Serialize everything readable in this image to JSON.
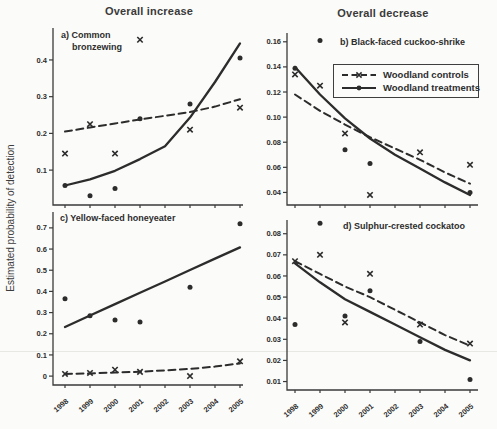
{
  "figure": {
    "column_titles": [
      "Overall increase",
      "Overall decrease"
    ],
    "y_axis_label": "Estimated probability of detection",
    "legend": {
      "position": "top-right panel b",
      "items": [
        {
          "label": "Woodland controls",
          "line": "dashed",
          "marker": "x"
        },
        {
          "label": "Woodland treatments",
          "line": "solid",
          "marker": "dot"
        }
      ]
    },
    "colors": {
      "ink": "#2c2c2c",
      "axis": "#3a3a3a",
      "paper": "#fbfbf9"
    }
  },
  "chart_data": [
    {
      "type": "line",
      "panel": "a",
      "label_lines": [
        "a) Common",
        "bronzewing"
      ],
      "column": "Overall increase",
      "x_categories": [
        "1998",
        "1999",
        "2000",
        "2001",
        "2002",
        "2003",
        "2004",
        "2005"
      ],
      "show_x_labels": false,
      "ylim": [
        0.005,
        0.487
      ],
      "yticks": [
        0.1,
        0.2,
        0.3,
        0.4
      ],
      "ytick_labels": [
        "0.1",
        "0.2",
        "0.3",
        "0.4"
      ],
      "series": [
        {
          "name": "Woodland controls",
          "line": "dashed",
          "marker": "x",
          "point_years": [
            1998,
            1999,
            2000,
            2001,
            2003,
            2005
          ],
          "point_values": [
            0.145,
            0.225,
            0.145,
            0.455,
            0.21,
            0.27
          ],
          "fit_values": [
            0.205,
            0.216,
            0.227,
            0.238,
            0.248,
            0.258,
            0.273,
            0.293
          ]
        },
        {
          "name": "Woodland treatments",
          "line": "solid",
          "marker": "dot",
          "point_years": [
            1998,
            1999,
            2000,
            2001,
            2003,
            2005
          ],
          "point_values": [
            0.058,
            0.03,
            0.05,
            0.24,
            0.28,
            0.405
          ],
          "fit_values": [
            0.058,
            0.075,
            0.098,
            0.13,
            0.165,
            0.243,
            0.34,
            0.445
          ]
        }
      ]
    },
    {
      "type": "line",
      "panel": "b",
      "label_lines": [
        "b) Black-faced cuckoo-shrike"
      ],
      "column": "Overall decrease",
      "x_categories": [
        "1998",
        "1999",
        "2000",
        "2001",
        "2002",
        "2003",
        "2004",
        "2005"
      ],
      "show_x_labels": false,
      "ylim": [
        0.03,
        0.167
      ],
      "yticks": [
        0.04,
        0.06,
        0.08,
        0.1,
        0.12,
        0.14,
        0.16
      ],
      "ytick_labels": [
        "0.04",
        "0.06",
        "0.08",
        "0.10",
        "0.12",
        "0.14",
        "0.16"
      ],
      "series": [
        {
          "name": "Woodland controls",
          "line": "dashed",
          "marker": "x",
          "point_years": [
            1998,
            1999,
            2000,
            2001,
            2003,
            2005
          ],
          "point_values": [
            0.134,
            0.125,
            0.087,
            0.038,
            0.072,
            0.062
          ],
          "fit_values": [
            0.118,
            0.105,
            0.094,
            0.084,
            0.075,
            0.066,
            0.056,
            0.047
          ]
        },
        {
          "name": "Woodland treatments",
          "line": "solid",
          "marker": "dot",
          "point_years": [
            1998,
            1999,
            2000,
            2001,
            2005
          ],
          "point_values": [
            0.139,
            0.161,
            0.074,
            0.063,
            0.04
          ],
          "fit_values": [
            0.14,
            0.118,
            0.099,
            0.083,
            0.07,
            0.059,
            0.048,
            0.038
          ]
        }
      ]
    },
    {
      "type": "line",
      "panel": "c",
      "label_lines": [
        "c) Yellow-faced honeyeater"
      ],
      "column": "Overall increase",
      "x_categories": [
        "1998",
        "1999",
        "2000",
        "2001",
        "2002",
        "2003",
        "2004",
        "2005"
      ],
      "show_x_labels": true,
      "ylim": [
        -0.042,
        0.775
      ],
      "yticks": [
        0,
        0.1,
        0.2,
        0.3,
        0.4,
        0.5,
        0.6,
        0.7
      ],
      "ytick_labels": [
        "0",
        "0.1",
        "0.2",
        "0.3",
        "0.4",
        "0.5",
        "0.6",
        "0.7"
      ],
      "series": [
        {
          "name": "Woodland controls",
          "line": "dashed",
          "marker": "x",
          "point_years": [
            1998,
            1999,
            2000,
            2001,
            2003,
            2005
          ],
          "point_values": [
            0.01,
            0.015,
            0.03,
            0.02,
            0.0,
            0.07
          ],
          "fit_values": [
            0.01,
            0.013,
            0.017,
            0.021,
            0.027,
            0.034,
            0.045,
            0.06
          ]
        },
        {
          "name": "Woodland treatments",
          "line": "solid",
          "marker": "dot",
          "point_years": [
            1998,
            1999,
            2000,
            2001,
            2003,
            2005
          ],
          "point_values": [
            0.365,
            0.285,
            0.265,
            0.255,
            0.42,
            0.72
          ],
          "fit_values": [
            0.232,
            0.286,
            0.34,
            0.394,
            0.447,
            0.501,
            0.555,
            0.608
          ]
        }
      ]
    },
    {
      "type": "line",
      "panel": "d",
      "label_lines": [
        "d) Sulphur-crested cockatoo"
      ],
      "column": "Overall decrease",
      "x_categories": [
        "1998",
        "1999",
        "2000",
        "2001",
        "2002",
        "2003",
        "2004",
        "2005"
      ],
      "show_x_labels": true,
      "ylim": [
        0.006,
        0.0865
      ],
      "yticks": [
        0.01,
        0.02,
        0.03,
        0.04,
        0.05,
        0.06,
        0.07,
        0.08
      ],
      "ytick_labels": [
        "0.01",
        "0.02",
        "0.03",
        "0.04",
        "0.05",
        "0.06",
        "0.07",
        "0.08"
      ],
      "series": [
        {
          "name": "Woodland controls",
          "line": "dashed",
          "marker": "x",
          "point_years": [
            1998,
            1999,
            2000,
            2001,
            2003,
            2005
          ],
          "point_values": [
            0.067,
            0.07,
            0.038,
            0.061,
            0.037,
            0.028
          ],
          "fit_values": [
            0.067,
            0.061,
            0.055,
            0.05,
            0.044,
            0.038,
            0.032,
            0.027
          ]
        },
        {
          "name": "Woodland treatments",
          "line": "solid",
          "marker": "dot",
          "point_years": [
            1998,
            1999,
            2000,
            2001,
            2003,
            2005
          ],
          "point_values": [
            0.037,
            0.085,
            0.041,
            0.053,
            0.029,
            0.011
          ],
          "fit_values": [
            0.066,
            0.057,
            0.049,
            0.043,
            0.037,
            0.031,
            0.025,
            0.02
          ]
        }
      ]
    }
  ]
}
